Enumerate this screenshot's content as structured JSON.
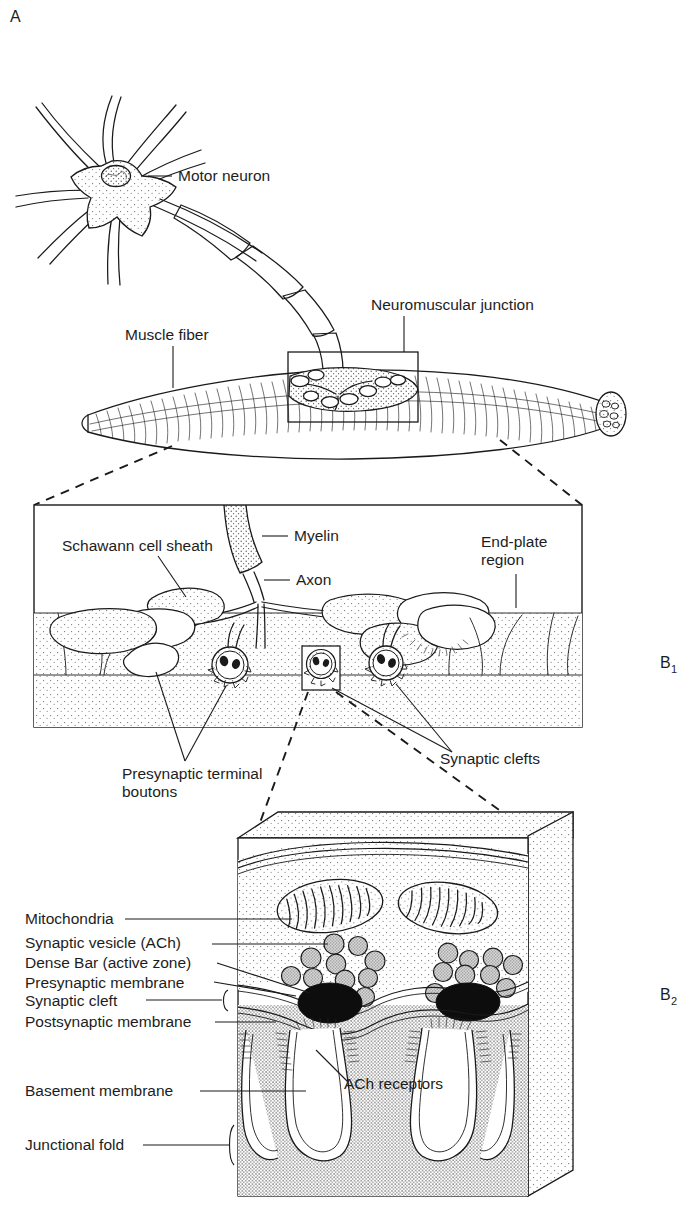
{
  "figure": {
    "title_semantic": "neuromuscular-junction-diagram",
    "panel_labels": {
      "a": "A",
      "b1": "B",
      "b1_sub": "1",
      "b2": "B",
      "b2_sub": "2"
    },
    "colors": {
      "ink": "#1a1a1a",
      "paper": "#ffffff",
      "stipple_light": "#efefef",
      "stipple_mid": "#dcdcdc",
      "vesicle_fill": "#c9c9c9",
      "dense_bar": "#0d0d0d"
    }
  },
  "panel_a": {
    "labels": [
      {
        "id": "motor-neuron",
        "text": "Motor neuron"
      },
      {
        "id": "muscle-fiber",
        "text": "Muscle fiber"
      },
      {
        "id": "neuromuscular-junction",
        "text": "Neuromuscular junction"
      }
    ]
  },
  "panel_b1": {
    "labels": [
      {
        "id": "schwann-cell-sheath",
        "text": "Schawann cell sheath"
      },
      {
        "id": "myelin",
        "text": "Myelin"
      },
      {
        "id": "axon",
        "text": "Axon"
      },
      {
        "id": "end-plate-region-line1",
        "text": "End-plate"
      },
      {
        "id": "end-plate-region-line2",
        "text": "region"
      },
      {
        "id": "presynaptic-terminal-boutons-line1",
        "text": "Presynaptic terminal"
      },
      {
        "id": "presynaptic-terminal-boutons-line2",
        "text": "boutons"
      },
      {
        "id": "synaptic-clefts",
        "text": "Synaptic clefts"
      }
    ]
  },
  "panel_b2": {
    "labels": [
      {
        "id": "mitochondria",
        "text": "Mitochondria"
      },
      {
        "id": "synaptic-vesicle-ach",
        "text": "Synaptic vesicle (ACh)"
      },
      {
        "id": "dense-bar-active-zone",
        "text": "Dense Bar (active zone)"
      },
      {
        "id": "presynaptic-membrane",
        "text": "Presynaptic membrane"
      },
      {
        "id": "synaptic-cleft",
        "text": "Synaptic cleft"
      },
      {
        "id": "postsynaptic-membrane",
        "text": "Postsynaptic membrane"
      },
      {
        "id": "basement-membrane",
        "text": "Basement membrane"
      },
      {
        "id": "junctional-fold",
        "text": "Junctional fold"
      },
      {
        "id": "ach-receptors",
        "text": "ACh receptors"
      }
    ]
  }
}
